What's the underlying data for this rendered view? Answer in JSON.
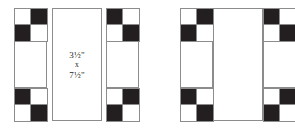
{
  "diagram": {
    "type": "quilt-block-construction",
    "palette": {
      "dark": "#231f20",
      "light": "#ffffff",
      "outline": "#8c8c8c",
      "background": "#ffffff"
    },
    "center_label": {
      "line1": "3½\"",
      "line2": "x",
      "line3": "7½\""
    },
    "pieces": [
      {
        "name": "left-sashing-strip",
        "role": "pieced sashing strip with four-patch corners",
        "top_fourpatch": [
          "light",
          "dark",
          "dark",
          "light"
        ],
        "bottom_fourpatch": [
          "dark",
          "light",
          "light",
          "dark"
        ]
      },
      {
        "name": "center-rectangle",
        "role": "plain center rectangle with size label",
        "label": "3½\" x 7½\""
      },
      {
        "name": "right-sashing-strip",
        "role": "pieced sashing strip with four-patch corners",
        "top_fourpatch": [
          "dark",
          "light",
          "light",
          "dark"
        ],
        "bottom_fourpatch": [
          "light",
          "dark",
          "dark",
          "light"
        ]
      },
      {
        "name": "assembled-block",
        "role": "completed block: left strip + center rectangle + right strip",
        "corners": {
          "top_left": [
            "light",
            "dark",
            "dark",
            "light"
          ],
          "top_right": [
            "dark",
            "light",
            "light",
            "dark"
          ],
          "bottom_left": [
            "dark",
            "light",
            "light",
            "dark"
          ],
          "bottom_right": [
            "light",
            "dark",
            "dark",
            "light"
          ]
        }
      }
    ]
  }
}
